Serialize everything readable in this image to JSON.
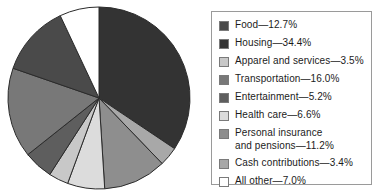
{
  "chart_data": {
    "type": "pie",
    "title": "",
    "subtitle": "",
    "xlabel": "",
    "ylabel": "",
    "legend_position": "right",
    "grid": false,
    "start_angle_deg": 0,
    "direction": "clockwise",
    "units": "percent",
    "total": 100.0,
    "categories": [
      "Food",
      "Housing",
      "Apparel and services",
      "Transportation",
      "Entertainment",
      "Health care",
      "Personal insurance and pensions",
      "Cash contributions",
      "All other"
    ],
    "values": [
      12.7,
      34.4,
      3.5,
      16.0,
      5.2,
      6.6,
      11.2,
      3.4,
      7.0
    ],
    "colors": [
      "#4a4a4a",
      "#333333",
      "#c8c8c8",
      "#787878",
      "#5e5e5e",
      "#dcdcdc",
      "#8e8e8e",
      "#a8a8a8",
      "#ffffff"
    ],
    "slice_order_clockwise_from_top": [
      "Housing",
      "Cash contributions",
      "Personal insurance and pensions",
      "Health care",
      "Apparel and services",
      "Entertainment",
      "Transportation",
      "Food",
      "All other"
    ],
    "slice_edge_color": "#2b2b2b"
  },
  "legend": {
    "border_color": "#9a9a9a",
    "items": [
      {
        "name": "Food",
        "label": "Food—12.7%",
        "value": 12.7,
        "color": "#4a4a4a",
        "multiline": false
      },
      {
        "name": "Housing",
        "label": "Housing—34.4%",
        "value": 34.4,
        "color": "#333333",
        "multiline": false
      },
      {
        "name": "Apparel and services",
        "label": "Apparel and services—3.5%",
        "value": 3.5,
        "color": "#c8c8c8",
        "multiline": false
      },
      {
        "name": "Transportation",
        "label": "Transportation—16.0%",
        "value": 16.0,
        "color": "#787878",
        "multiline": false
      },
      {
        "name": "Entertainment",
        "label": "Entertainment—5.2%",
        "value": 5.2,
        "color": "#5e5e5e",
        "multiline": false
      },
      {
        "name": "Health care",
        "label": "Health care—6.6%",
        "value": 6.6,
        "color": "#dcdcdc",
        "multiline": false
      },
      {
        "name": "Personal insurance and pensions",
        "label": "Personal insurance\nand pensions—11.2%",
        "value": 11.2,
        "color": "#8e8e8e",
        "multiline": true
      },
      {
        "name": "Cash contributions",
        "label": "Cash contributions—3.4%",
        "value": 3.4,
        "color": "#a8a8a8",
        "multiline": false
      },
      {
        "name": "All other",
        "label": "All other—7.0%",
        "value": 7.0,
        "color": "#ffffff",
        "multiline": false
      }
    ]
  }
}
